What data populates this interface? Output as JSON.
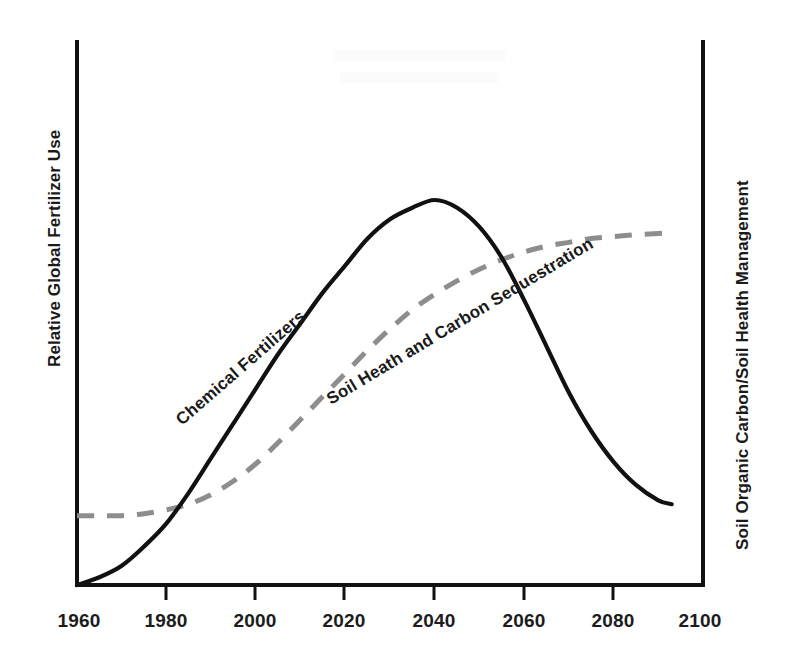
{
  "chart_data": {
    "type": "line",
    "title": "",
    "subtitle": "",
    "xlabel": "",
    "ylabel": "Relative Global Fertilizer Use",
    "y2label": "Soil Organic Carbon/Soil Health Management",
    "xlim": [
      1960,
      2100
    ],
    "ylim": [
      0,
      1
    ],
    "grid": false,
    "legend_position": "inline-annotations",
    "xticks": [
      1960,
      1980,
      2000,
      2020,
      2040,
      2060,
      2080,
      2100
    ],
    "xtick_labels": [
      "1960",
      "1980",
      "2000",
      "2020",
      "2040",
      "2060",
      "2080",
      "2100"
    ],
    "yticks": [],
    "ytick_labels": [],
    "annotations": [
      {
        "name": "chemical-fertilizers-label",
        "text": "Chemical Fertilizers",
        "x": 1991,
        "y": 0.43,
        "rotation": -41
      },
      {
        "name": "soil-health-label",
        "text": "Soil Heath and Carbon Sequestration",
        "x": 2020,
        "y": 0.45,
        "rotation": -31
      }
    ],
    "series": [
      {
        "name": "Chemical Fertilizers",
        "style": "solid",
        "color": "#111111",
        "x": [
          1960,
          1965,
          1970,
          1975,
          1980,
          1985,
          1990,
          1995,
          2000,
          2005,
          2010,
          2015,
          2020,
          2025,
          2030,
          2035,
          2040,
          2045,
          2050,
          2055,
          2060,
          2065,
          2070,
          2075,
          2080,
          2085,
          2090,
          2093
        ],
        "values": [
          0.0,
          0.02,
          0.05,
          0.1,
          0.16,
          0.24,
          0.33,
          0.42,
          0.51,
          0.6,
          0.68,
          0.76,
          0.83,
          0.9,
          0.95,
          0.98,
          1.0,
          0.98,
          0.93,
          0.85,
          0.74,
          0.62,
          0.5,
          0.4,
          0.32,
          0.26,
          0.22,
          0.21
        ]
      },
      {
        "name": "Soil Heath and Carbon Sequestration",
        "style": "dashed",
        "color": "#8d8d8d",
        "x": [
          1960,
          1965,
          1970,
          1975,
          1980,
          1985,
          1990,
          1995,
          2000,
          2005,
          2010,
          2015,
          2020,
          2025,
          2030,
          2035,
          2040,
          2045,
          2050,
          2055,
          2060,
          2065,
          2070,
          2075,
          2080,
          2085,
          2090,
          2093
        ],
        "values": [
          0.18,
          0.18,
          0.18,
          0.185,
          0.195,
          0.21,
          0.235,
          0.27,
          0.315,
          0.37,
          0.43,
          0.49,
          0.55,
          0.61,
          0.665,
          0.715,
          0.755,
          0.79,
          0.82,
          0.845,
          0.865,
          0.88,
          0.89,
          0.9,
          0.905,
          0.91,
          0.913,
          0.915
        ]
      }
    ]
  },
  "axes": {
    "left_title": "Relative Global Fertilizer Use",
    "right_title": "Soil Organic Carbon/Soil Health Management"
  }
}
